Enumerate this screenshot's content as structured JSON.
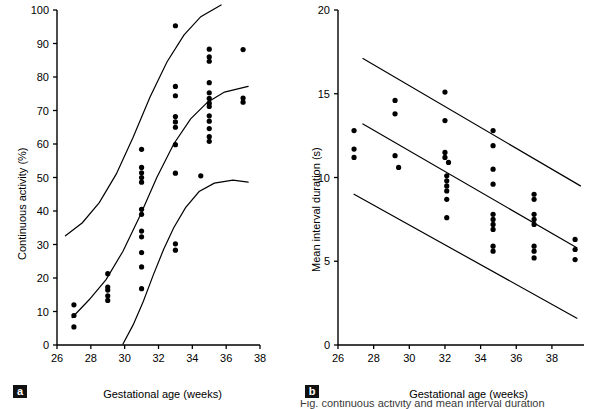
{
  "figure": {
    "panels": [
      "a",
      "b"
    ],
    "caption_partial": "Fig. continuous activity and mean interval duration"
  },
  "panel_a": {
    "label": "a",
    "xlabel": "Gestational age (weeks)",
    "ylabel": "Continuous activity (%)"
  },
  "panel_b": {
    "label": "b",
    "xlabel": "Gestational age (weeks)",
    "ylabel": "Mean interval duration (s)"
  },
  "chart_data": [
    {
      "type": "scatter",
      "panel": "a",
      "title": "",
      "xlabel": "Gestational age (weeks)",
      "ylabel": "Continuous activity (%)",
      "xlim": [
        26,
        38
      ],
      "ylim": [
        0,
        100
      ],
      "xticks": [
        26,
        28,
        30,
        32,
        34,
        36,
        38
      ],
      "yticks": [
        0,
        10,
        20,
        30,
        40,
        50,
        60,
        70,
        80,
        90,
        100
      ],
      "grid": false,
      "legend": "none",
      "marker": "filled-circle",
      "points": [
        {
          "x": 27.0,
          "y": 12.0
        },
        {
          "x": 27.0,
          "y": 8.8
        },
        {
          "x": 27.0,
          "y": 5.4
        },
        {
          "x": 29.0,
          "y": 21.3
        },
        {
          "x": 29.0,
          "y": 17.3
        },
        {
          "x": 29.0,
          "y": 16.4
        },
        {
          "x": 29.0,
          "y": 14.7
        },
        {
          "x": 29.0,
          "y": 13.3
        },
        {
          "x": 31.0,
          "y": 58.4
        },
        {
          "x": 31.0,
          "y": 53.0
        },
        {
          "x": 31.0,
          "y": 51.4
        },
        {
          "x": 31.0,
          "y": 50.0
        },
        {
          "x": 31.0,
          "y": 48.6
        },
        {
          "x": 31.0,
          "y": 40.5
        },
        {
          "x": 31.0,
          "y": 39.0
        },
        {
          "x": 31.0,
          "y": 34.0
        },
        {
          "x": 31.0,
          "y": 32.3
        },
        {
          "x": 31.0,
          "y": 27.6
        },
        {
          "x": 31.0,
          "y": 23.3
        },
        {
          "x": 31.0,
          "y": 16.8
        },
        {
          "x": 33.0,
          "y": 95.3
        },
        {
          "x": 33.0,
          "y": 77.2
        },
        {
          "x": 33.0,
          "y": 74.4
        },
        {
          "x": 33.0,
          "y": 68.2
        },
        {
          "x": 33.0,
          "y": 66.6
        },
        {
          "x": 33.0,
          "y": 65.0
        },
        {
          "x": 33.0,
          "y": 59.8
        },
        {
          "x": 33.0,
          "y": 51.3
        },
        {
          "x": 33.0,
          "y": 30.2
        },
        {
          "x": 33.0,
          "y": 28.3
        },
        {
          "x": 34.5,
          "y": 50.5
        },
        {
          "x": 35.0,
          "y": 88.3
        },
        {
          "x": 35.0,
          "y": 86.0
        },
        {
          "x": 35.0,
          "y": 84.7
        },
        {
          "x": 35.0,
          "y": 78.3
        },
        {
          "x": 35.0,
          "y": 75.3
        },
        {
          "x": 35.0,
          "y": 73.6
        },
        {
          "x": 35.0,
          "y": 72.2
        },
        {
          "x": 35.0,
          "y": 71.2
        },
        {
          "x": 35.0,
          "y": 68.4
        },
        {
          "x": 35.0,
          "y": 66.8
        },
        {
          "x": 35.0,
          "y": 64.6
        },
        {
          "x": 35.0,
          "y": 62.2
        },
        {
          "x": 35.0,
          "y": 60.8
        },
        {
          "x": 37.0,
          "y": 88.2
        },
        {
          "x": 37.0,
          "y": 73.7
        },
        {
          "x": 37.0,
          "y": 72.5
        }
      ],
      "curves": [
        {
          "name": "upper-centile",
          "points": [
            [
              26.5,
              32.6
            ],
            [
              27.5,
              36.5
            ],
            [
              28.5,
              42.5
            ],
            [
              29.5,
              51.0
            ],
            [
              30.5,
              62.0
            ],
            [
              31.5,
              74.0
            ],
            [
              32.5,
              84.5
            ],
            [
              33.5,
              92.5
            ],
            [
              34.5,
              98.0
            ],
            [
              35.7,
              101.5
            ]
          ]
        },
        {
          "name": "median-centile",
          "points": [
            [
              26.9,
              8.2
            ],
            [
              27.9,
              13.5
            ],
            [
              28.9,
              19.5
            ],
            [
              29.9,
              28.0
            ],
            [
              30.9,
              38.5
            ],
            [
              31.9,
              50.0
            ],
            [
              32.9,
              60.0
            ],
            [
              33.9,
              67.5
            ],
            [
              34.9,
              72.5
            ],
            [
              35.9,
              75.5
            ],
            [
              37.3,
              77.2
            ]
          ]
        },
        {
          "name": "lower-centile",
          "points": [
            [
              29.9,
              0.3
            ],
            [
              30.5,
              6.0
            ],
            [
              31.1,
              13.0
            ],
            [
              31.7,
              21.0
            ],
            [
              32.3,
              28.5
            ],
            [
              32.9,
              35.0
            ],
            [
              33.6,
              41.0
            ],
            [
              34.4,
              45.8
            ],
            [
              35.3,
              48.3
            ],
            [
              36.4,
              49.2
            ],
            [
              37.3,
              48.6
            ]
          ]
        }
      ]
    },
    {
      "type": "scatter",
      "panel": "b",
      "title": "",
      "xlabel": "Gestational age (weeks)",
      "ylabel": "Mean interval duration (s)",
      "xlim": [
        26,
        39.8
      ],
      "ylim": [
        0,
        20
      ],
      "xticks": [
        26,
        28,
        30,
        32,
        34,
        36,
        38
      ],
      "yticks": [
        0,
        5,
        10,
        15,
        20
      ],
      "grid": false,
      "legend": "none",
      "marker": "filled-circle",
      "points": [
        {
          "x": 26.9,
          "y": 12.8
        },
        {
          "x": 26.9,
          "y": 11.7
        },
        {
          "x": 26.9,
          "y": 11.2
        },
        {
          "x": 29.2,
          "y": 14.6
        },
        {
          "x": 29.2,
          "y": 13.8
        },
        {
          "x": 29.2,
          "y": 11.3
        },
        {
          "x": 29.4,
          "y": 10.6
        },
        {
          "x": 32.0,
          "y": 15.1
        },
        {
          "x": 32.0,
          "y": 13.4
        },
        {
          "x": 32.0,
          "y": 11.5
        },
        {
          "x": 32.0,
          "y": 11.2
        },
        {
          "x": 32.2,
          "y": 10.9
        },
        {
          "x": 32.1,
          "y": 10.1
        },
        {
          "x": 32.1,
          "y": 9.8
        },
        {
          "x": 32.1,
          "y": 9.5
        },
        {
          "x": 32.1,
          "y": 9.2
        },
        {
          "x": 32.1,
          "y": 8.7
        },
        {
          "x": 32.1,
          "y": 7.6
        },
        {
          "x": 34.7,
          "y": 12.8
        },
        {
          "x": 34.7,
          "y": 11.9
        },
        {
          "x": 34.7,
          "y": 10.5
        },
        {
          "x": 34.7,
          "y": 9.6
        },
        {
          "x": 34.7,
          "y": 7.8
        },
        {
          "x": 34.7,
          "y": 7.5
        },
        {
          "x": 34.7,
          "y": 7.2
        },
        {
          "x": 34.7,
          "y": 6.9
        },
        {
          "x": 34.7,
          "y": 5.9
        },
        {
          "x": 34.7,
          "y": 5.6
        },
        {
          "x": 37.0,
          "y": 9.0
        },
        {
          "x": 37.0,
          "y": 8.7
        },
        {
          "x": 37.0,
          "y": 7.8
        },
        {
          "x": 37.0,
          "y": 7.5
        },
        {
          "x": 37.0,
          "y": 7.2
        },
        {
          "x": 37.0,
          "y": 5.9
        },
        {
          "x": 37.0,
          "y": 5.6
        },
        {
          "x": 37.0,
          "y": 5.2
        },
        {
          "x": 39.3,
          "y": 6.3
        },
        {
          "x": 39.3,
          "y": 5.7
        },
        {
          "x": 39.3,
          "y": 5.1
        }
      ],
      "curves": [
        {
          "name": "upper-centile",
          "points": [
            [
              27.4,
              17.1
            ],
            [
              39.6,
              9.5
            ]
          ]
        },
        {
          "name": "median-centile",
          "points": [
            [
              27.4,
              13.2
            ],
            [
              39.4,
              5.8
            ]
          ]
        },
        {
          "name": "lower-centile",
          "points": [
            [
              26.9,
              9.0
            ],
            [
              39.4,
              1.6
            ]
          ]
        }
      ]
    }
  ]
}
